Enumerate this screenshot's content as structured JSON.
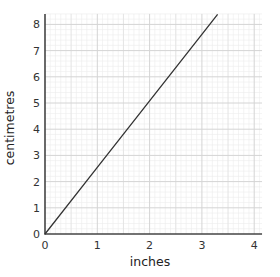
{
  "chart_data": {
    "type": "line",
    "title": "",
    "xlabel": "inches",
    "ylabel": "centimetres",
    "xlim": [
      0,
      4.15
    ],
    "ylim": [
      0,
      8.4
    ],
    "x_ticks": [
      0,
      1,
      2,
      3,
      4
    ],
    "y_ticks": [
      0,
      1,
      2,
      3,
      4,
      5,
      6,
      7,
      8
    ],
    "x_tick_labels": [
      "0",
      "1",
      "2",
      "3",
      "4"
    ],
    "y_tick_labels": [
      "0",
      "1",
      "2",
      "3",
      "4",
      "5",
      "6",
      "7",
      "8"
    ],
    "grid": true,
    "legend": null,
    "series": [
      {
        "name": "inches to centimetres",
        "x": [
          0,
          1,
          2,
          3,
          3.3
        ],
        "y": [
          0,
          2.54,
          5.08,
          7.62,
          8.38
        ],
        "color": "#333333"
      }
    ]
  },
  "colors": {
    "axis": "#444444",
    "major_grid": "#d4d4d4",
    "minor_grid": "#ececec",
    "line": "#333333"
  }
}
